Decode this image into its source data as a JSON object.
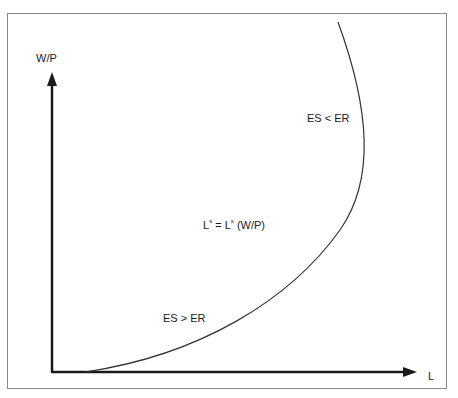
{
  "diagram": {
    "title": "",
    "y_axis_label": "W/P",
    "x_axis_label": "L",
    "curve_label": {
      "lhs_base": "L",
      "lhs_sup": "s",
      "eq": "=",
      "rhs_base": "L",
      "rhs_sup": "s",
      "rhs_arg": "(W/P)"
    },
    "region_upper": "ES < ER",
    "region_lower": "ES > ER",
    "colors": {
      "axis": "#1a1a1a",
      "curve": "#333333",
      "frame": "#8a8a8a"
    }
  }
}
